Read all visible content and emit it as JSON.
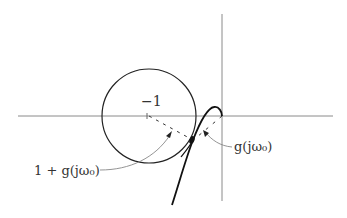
{
  "diagram": {
    "labels": {
      "minus_one": "−1",
      "one_plus_g": "1 + g(jω₀)",
      "g": "g(jω₀)"
    },
    "colors": {
      "axis": "#888888",
      "curve": "#111111",
      "annotation": "#777777",
      "text": "#333333"
    }
  }
}
